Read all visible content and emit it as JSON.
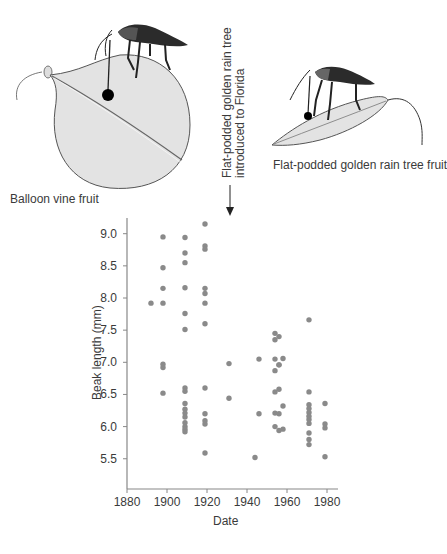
{
  "illustrations": {
    "left_caption": "Balloon vine fruit",
    "right_caption": "Flat-podded golden rain tree fruit",
    "annotation_line1": "Flat-podded golden rain tree",
    "annotation_line2": "introduced to Florida"
  },
  "colors": {
    "dot": "#8a8a8a",
    "axis": "#888888",
    "fruit_fill": "#e3e3e3",
    "text": "#3a3a3a"
  },
  "chart_data": {
    "type": "scatter",
    "title": "",
    "xlabel": "Date",
    "ylabel": "Beak length (mm)",
    "xlim": [
      1880,
      1985
    ],
    "ylim": [
      5.05,
      9.2
    ],
    "xticks": [
      1880,
      1900,
      1920,
      1940,
      1960,
      1980
    ],
    "xtick_labels": [
      "1880",
      "1900",
      "1920",
      "1940",
      "1960",
      "1980"
    ],
    "yticks": [
      5.5,
      6.0,
      6.5,
      7.0,
      7.5,
      8.0,
      8.5,
      9.0
    ],
    "ytick_labels": [
      "5.5",
      "6.0",
      "6.5",
      "7.0",
      "7.5",
      "8.0",
      "8.5",
      "9.0"
    ],
    "grid": false,
    "legend": null,
    "annotation": {
      "text": "Flat-podded golden rain tree introduced to Florida",
      "x": 1926,
      "arrow": "down"
    },
    "points": [
      {
        "x": 1892,
        "y": 7.92
      },
      {
        "x": 1898,
        "y": 8.95
      },
      {
        "x": 1898,
        "y": 8.47
      },
      {
        "x": 1898,
        "y": 8.15
      },
      {
        "x": 1898,
        "y": 7.92
      },
      {
        "x": 1898,
        "y": 6.97
      },
      {
        "x": 1898,
        "y": 6.92
      },
      {
        "x": 1898,
        "y": 6.52
      },
      {
        "x": 1909,
        "y": 8.94
      },
      {
        "x": 1909,
        "y": 8.7
      },
      {
        "x": 1909,
        "y": 8.55
      },
      {
        "x": 1909,
        "y": 8.16
      },
      {
        "x": 1909,
        "y": 7.76
      },
      {
        "x": 1909,
        "y": 7.51
      },
      {
        "x": 1909,
        "y": 6.6
      },
      {
        "x": 1909,
        "y": 6.55
      },
      {
        "x": 1909,
        "y": 6.36
      },
      {
        "x": 1909,
        "y": 6.27
      },
      {
        "x": 1909,
        "y": 6.21
      },
      {
        "x": 1909,
        "y": 6.15
      },
      {
        "x": 1909,
        "y": 6.06
      },
      {
        "x": 1909,
        "y": 6.0
      },
      {
        "x": 1909,
        "y": 5.96
      },
      {
        "x": 1909,
        "y": 5.92
      },
      {
        "x": 1919,
        "y": 9.15
      },
      {
        "x": 1919,
        "y": 8.81
      },
      {
        "x": 1919,
        "y": 8.76
      },
      {
        "x": 1919,
        "y": 8.15
      },
      {
        "x": 1919,
        "y": 8.07
      },
      {
        "x": 1919,
        "y": 7.92
      },
      {
        "x": 1919,
        "y": 7.6
      },
      {
        "x": 1919,
        "y": 6.6
      },
      {
        "x": 1919,
        "y": 6.2
      },
      {
        "x": 1919,
        "y": 6.09
      },
      {
        "x": 1919,
        "y": 6.04
      },
      {
        "x": 1919,
        "y": 5.59
      },
      {
        "x": 1931,
        "y": 6.98
      },
      {
        "x": 1931,
        "y": 6.44
      },
      {
        "x": 1944,
        "y": 5.52
      },
      {
        "x": 1946,
        "y": 7.05
      },
      {
        "x": 1946,
        "y": 6.2
      },
      {
        "x": 1954,
        "y": 7.45
      },
      {
        "x": 1954,
        "y": 7.35
      },
      {
        "x": 1954,
        "y": 7.05
      },
      {
        "x": 1954,
        "y": 6.87
      },
      {
        "x": 1954,
        "y": 6.54
      },
      {
        "x": 1954,
        "y": 6.21
      },
      {
        "x": 1954,
        "y": 6.0
      },
      {
        "x": 1956,
        "y": 7.4
      },
      {
        "x": 1956,
        "y": 6.96
      },
      {
        "x": 1956,
        "y": 6.96
      },
      {
        "x": 1956,
        "y": 6.58
      },
      {
        "x": 1956,
        "y": 6.2
      },
      {
        "x": 1956,
        "y": 5.94
      },
      {
        "x": 1958,
        "y": 7.06
      },
      {
        "x": 1958,
        "y": 6.32
      },
      {
        "x": 1958,
        "y": 5.96
      },
      {
        "x": 1971,
        "y": 7.66
      },
      {
        "x": 1971,
        "y": 6.54
      },
      {
        "x": 1971,
        "y": 6.34
      },
      {
        "x": 1971,
        "y": 6.28
      },
      {
        "x": 1971,
        "y": 6.22
      },
      {
        "x": 1971,
        "y": 6.16
      },
      {
        "x": 1971,
        "y": 6.11
      },
      {
        "x": 1971,
        "y": 6.05
      },
      {
        "x": 1971,
        "y": 5.9
      },
      {
        "x": 1971,
        "y": 5.8
      },
      {
        "x": 1971,
        "y": 5.72
      },
      {
        "x": 1979,
        "y": 6.36
      },
      {
        "x": 1979,
        "y": 6.04
      },
      {
        "x": 1979,
        "y": 5.98
      },
      {
        "x": 1979,
        "y": 5.53
      }
    ]
  }
}
